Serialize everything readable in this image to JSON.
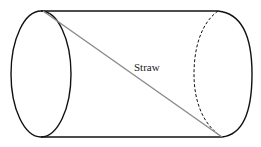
{
  "diagram": {
    "labels": {
      "straw": "Straw"
    },
    "colors": {
      "outline": "#111111",
      "straw": "#8a8a8a",
      "background": "#ffffff"
    }
  }
}
